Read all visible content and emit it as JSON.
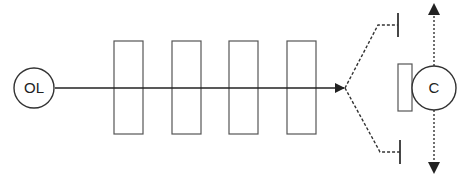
{
  "diagram": {
    "source_node": {
      "label": "OL"
    },
    "target_node": {
      "label": "C"
    },
    "elements": {
      "boxes_count": 4,
      "branches": [
        "upper",
        "lower"
      ],
      "motion_arrows": [
        "up",
        "down"
      ]
    },
    "colors": {
      "stroke": "#333333",
      "box_stroke": "#555555",
      "background": "#ffffff"
    }
  }
}
